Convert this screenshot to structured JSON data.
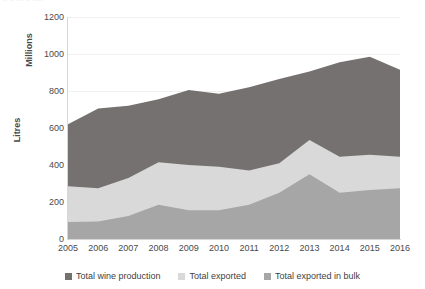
{
  "top_artifact_text": "∙∙  ∙∙ ∙∙∙ ∙∙ ∙∙∙∙",
  "axis_titles": {
    "secondary_units": "Millions",
    "y": "Litres"
  },
  "colors": {
    "total_wine_production": "#767171",
    "total_exported": "#d9d9d9",
    "total_exported_in_bulk": "#a6a6a6",
    "gridline": "#f0f0f0",
    "axis": "#d6d6d6",
    "text": "#3f3f3f",
    "background": "#ffffff"
  },
  "legend": {
    "items": [
      {
        "label": "Total wine production",
        "color": "#767171"
      },
      {
        "label": "Total exported",
        "color": "#d9d9d9"
      },
      {
        "label": "Total exported in bulk",
        "color": "#a6a6a6"
      }
    ]
  },
  "chart_data": {
    "type": "area",
    "stacked": false,
    "title": "",
    "subtitle": "",
    "xlabel": "",
    "ylabel": "Litres",
    "y_units": "Millions",
    "xlim": [
      2005,
      2016
    ],
    "ylim": [
      0,
      1200
    ],
    "ytick_step": 200,
    "grid": true,
    "legend_position": "bottom",
    "x": [
      2005,
      2006,
      2007,
      2008,
      2009,
      2010,
      2011,
      2012,
      2013,
      2014,
      2015,
      2016
    ],
    "categories": [
      "2005",
      "2006",
      "2007",
      "2008",
      "2009",
      "2010",
      "2011",
      "2012",
      "2013",
      "2014",
      "2015",
      "2016"
    ],
    "yticks": [
      0,
      200,
      400,
      600,
      800,
      1000,
      1200
    ],
    "ytick_labels": [
      "0",
      "200",
      "400",
      "600",
      "800",
      "1000",
      "1200"
    ],
    "series": [
      {
        "name": "Total wine production",
        "color": "#767171",
        "values": [
          620,
          705,
          720,
          755,
          805,
          785,
          820,
          865,
          905,
          955,
          985,
          915
        ]
      },
      {
        "name": "Total exported",
        "color": "#d9d9d9",
        "values": [
          285,
          275,
          330,
          415,
          400,
          390,
          370,
          410,
          535,
          445,
          455,
          445
        ]
      },
      {
        "name": "Total exported in bulk",
        "color": "#a6a6a6",
        "values": [
          92,
          95,
          125,
          185,
          155,
          155,
          185,
          250,
          350,
          250,
          265,
          275
        ]
      }
    ]
  }
}
